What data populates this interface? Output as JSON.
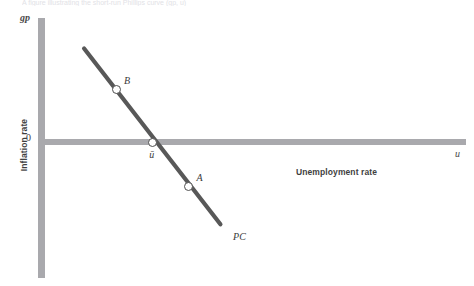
{
  "figure": {
    "top_sliver_text": "A figure illustrating the short-run Phillips curve (gp, u)"
  },
  "axes": {
    "y_symbol": "gp",
    "x_symbol": "u",
    "y_title": "Inflation rate",
    "x_title": "Unemployment rate",
    "origin_value": "0",
    "natural_rate_label": "ū"
  },
  "colors": {
    "axis": "#a9a9ad",
    "curve": "#585858",
    "marker_stroke": "#4f4f4f",
    "marker_fill": "#ffffff",
    "text": "#3a3a3a",
    "background": "#ffffff"
  },
  "chart_data": {
    "type": "line",
    "title": "",
    "subtitle": "",
    "xlabel": "Unemployment rate",
    "ylabel": "Inflation rate",
    "xlim": [
      0,
      10
    ],
    "ylim": [
      -6,
      6
    ],
    "grid": false,
    "legend_position": "none",
    "series": [
      {
        "name": "PC",
        "label": "PC",
        "type": "line",
        "color": "#585858",
        "x": [
          1.0,
          4.2
        ],
        "values": [
          5.0,
          -4.4
        ],
        "description": "Downward-sloping short-run Phillips curve crossing zero inflation at the natural rate of unemployment"
      }
    ],
    "points": [
      {
        "label": "B",
        "x": 1.75,
        "y": 2.8,
        "marker": "open-circle",
        "description": "High inflation, low unemployment"
      },
      {
        "label": "ū",
        "x": 2.6,
        "y": 0.0,
        "marker": "open-circle",
        "description": "Natural rate of unemployment at zero inflation"
      },
      {
        "label": "A",
        "x": 3.45,
        "y": -2.4,
        "marker": "open-circle",
        "description": "Negative inflation, high unemployment"
      }
    ],
    "annotations": [
      {
        "text": "PC",
        "x": 4.45,
        "y": -5.1
      },
      {
        "text": "0",
        "x": -0.35,
        "y": 0.25
      },
      {
        "text": "gp",
        "x": -0.3,
        "y": 5.9
      },
      {
        "text": "u",
        "x": 9.85,
        "y": -0.55
      }
    ]
  }
}
